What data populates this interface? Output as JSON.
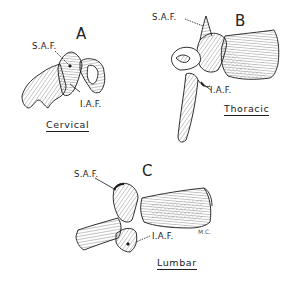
{
  "figure": {
    "panels": [
      {
        "id": "A",
        "letter": "A",
        "caption": "Cervical",
        "labels": {
          "superior": "S.A.F.",
          "inferior": "I.A.F."
        }
      },
      {
        "id": "B",
        "letter": "B",
        "caption": "Thoracic",
        "labels": {
          "superior": "S.A.F.",
          "inferior": "I.A.F."
        }
      },
      {
        "id": "C",
        "letter": "C",
        "caption": "Lumbar",
        "labels": {
          "superior": "S.A.F.",
          "inferior": "I.A.F."
        },
        "artist_initials": "M.C."
      }
    ],
    "colors": {
      "ink": "#1a1a1a",
      "background": "#ffffff"
    }
  }
}
